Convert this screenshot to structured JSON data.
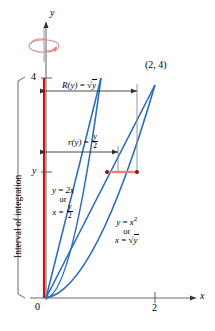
{
  "figure": {
    "axes": {
      "x_axis_label": "x",
      "y_axis_label": "y",
      "origin_label": "0",
      "x_ticks": [
        {
          "value": "2",
          "x": 2
        }
      ],
      "y_ticks": [
        {
          "value": "4",
          "y": 4
        },
        {
          "value": "y",
          "y": "y"
        }
      ],
      "x_range": [
        0,
        2.6
      ],
      "y_range": [
        0,
        4.6
      ]
    },
    "interval_bracket_label": "Interval of integration",
    "point_label": "(2, 4)",
    "measurements": [
      {
        "name": "outer-radius",
        "symbol": "R(y)",
        "equals": "=",
        "value_text": "√y",
        "value_kind": "sqrt",
        "value_arg": "y",
        "at_y": 4,
        "from_x": 0,
        "to_x": "sqrt(y)"
      },
      {
        "name": "inner-radius",
        "symbol": "r(y)",
        "equals": "=",
        "value_text": "y/2",
        "value_kind": "fraction",
        "numerator": "y",
        "denominator": "2",
        "at_y": 3,
        "from_x": 0,
        "to_x": "y/2"
      }
    ],
    "curves": [
      {
        "name": "line",
        "label_lines": [
          "y = 2x",
          "or",
          "x = y/2"
        ],
        "eq1_lhs": "y",
        "eq1_rhs": "2x",
        "connector": "or",
        "eq2_lhs": "x",
        "eq2_numerator": "y",
        "eq2_denominator": "2",
        "color": "#2b6cb8"
      },
      {
        "name": "parabola",
        "label_lines": [
          "y = x²",
          "or",
          "x = √y"
        ],
        "eq1_lhs": "y",
        "eq1_rhs": "x",
        "eq1_exp": "2",
        "connector": "or",
        "eq2_lhs": "x",
        "eq2_rhs_arg": "y",
        "color": "#2b6cb8"
      }
    ],
    "rotation_indicator": {
      "name": "axis-of-revolution-arrow",
      "color": "#d98a8a"
    },
    "colors": {
      "curve_blue": "#2b6cb8",
      "axis_red": "#c0151b",
      "washer_red": "#e8817d",
      "rotation_pink": "#d98a8a",
      "guide_gray": "#8a8a8a",
      "axis_black": "#555555",
      "text_black": "#000000"
    }
  }
}
